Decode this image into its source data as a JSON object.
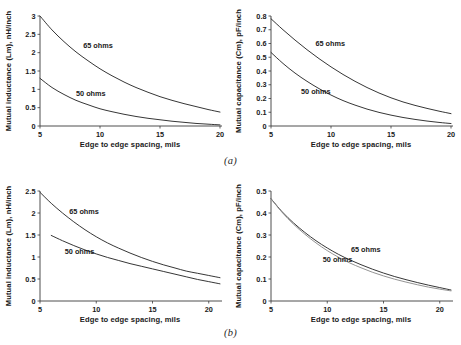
{
  "figure": {
    "captions": {
      "a": "(a)",
      "b": "(b)"
    }
  },
  "panels": [
    {
      "id": "a-left",
      "xlabel": "Edge to edge spacing, mils",
      "ylabel": "Mutual inductance (Lm), nH/inch",
      "labels": {
        "series1": "65 ohms",
        "series2": "50 ohms"
      },
      "ticks": {
        "x": [
          "5",
          "10",
          "15",
          "20"
        ],
        "y": [
          "0",
          "0.5",
          "1",
          "1.5",
          "2",
          "2.5",
          "3"
        ]
      }
    },
    {
      "id": "a-right",
      "xlabel": "Edge to edge spacing, mils",
      "ylabel": "Mutual capacitance (Cm), pF/inch",
      "labels": {
        "series1": "65 ohms",
        "series2": "50 ohms"
      },
      "ticks": {
        "x": [
          "5",
          "10",
          "15",
          "20"
        ],
        "y": [
          "0",
          "0.1",
          "0.2",
          "0.3",
          "0.4",
          "0.5",
          "0.6",
          "0.7",
          "0.8"
        ]
      }
    },
    {
      "id": "b-left",
      "xlabel": "Edge to edge spacing, mils",
      "ylabel": "Mutual inductance (Lm), nH/inch",
      "labels": {
        "series1": "65 ohms",
        "series2": "50 ohms"
      },
      "ticks": {
        "x": [
          "5",
          "10",
          "15",
          "20"
        ],
        "y": [
          "0",
          "0.5",
          "1",
          "1.5",
          "2",
          "2.5"
        ]
      }
    },
    {
      "id": "b-right",
      "xlabel": "Edge to edge spacing, mils",
      "ylabel": "Mutual capacitance (Cm), pF/inch",
      "labels": {
        "series1": "65 ohms",
        "series2": "50 ohms"
      },
      "ticks": {
        "x": [
          "5",
          "10",
          "15",
          "20"
        ],
        "y": [
          "0",
          "0.1",
          "0.2",
          "0.3",
          "0.4",
          "0.5"
        ]
      }
    }
  ],
  "chart_data": [
    {
      "id": "a-left",
      "type": "line",
      "title": "",
      "xlabel": "Edge to edge spacing, mils",
      "ylabel": "Mutual inductance (Lm), nH/inch",
      "xlim": [
        5,
        20
      ],
      "ylim": [
        0,
        3
      ],
      "xticks": [
        5,
        10,
        15,
        20
      ],
      "yticks": [
        0,
        0.5,
        1,
        1.5,
        2,
        2.5,
        3
      ],
      "grid": false,
      "legend": "inline-annotations",
      "series": [
        {
          "name": "65 ohms",
          "color": "#2b2b2b",
          "label_pos": [
            8.6,
            2.12
          ],
          "x": [
            5,
            6,
            7,
            8,
            9,
            10,
            11,
            12,
            13,
            14,
            15,
            16,
            17,
            18,
            19,
            20
          ],
          "values": [
            3.0,
            2.62,
            2.3,
            2.02,
            1.78,
            1.56,
            1.37,
            1.2,
            1.05,
            0.92,
            0.8,
            0.7,
            0.61,
            0.53,
            0.45,
            0.38
          ]
        },
        {
          "name": "50 ohms",
          "color": "#2b2b2b",
          "label_pos": [
            8.0,
            0.82
          ],
          "x": [
            5,
            6,
            7,
            8,
            9,
            10,
            11,
            12,
            13,
            14,
            15,
            16,
            17,
            18,
            19,
            20
          ],
          "values": [
            1.3,
            1.05,
            0.86,
            0.7,
            0.58,
            0.47,
            0.39,
            0.32,
            0.26,
            0.21,
            0.17,
            0.13,
            0.1,
            0.07,
            0.05,
            0.03
          ]
        }
      ]
    },
    {
      "id": "a-right",
      "type": "line",
      "title": "",
      "xlabel": "Edge to edge spacing, mils",
      "ylabel": "Mutual capacitance (Cm), pF/inch",
      "xlim": [
        5,
        20
      ],
      "ylim": [
        0,
        0.8
      ],
      "xticks": [
        5,
        10,
        15,
        20
      ],
      "yticks": [
        0,
        0.1,
        0.2,
        0.3,
        0.4,
        0.5,
        0.6,
        0.7,
        0.8
      ],
      "grid": false,
      "legend": "inline-annotations",
      "series": [
        {
          "name": "65 ohms",
          "color": "#2b2b2b",
          "label_pos": [
            8.7,
            0.585
          ],
          "x": [
            5,
            6,
            7,
            8,
            9,
            10,
            11,
            12,
            13,
            14,
            15,
            16,
            17,
            18,
            19,
            20
          ],
          "values": [
            0.78,
            0.7,
            0.625,
            0.555,
            0.49,
            0.43,
            0.375,
            0.325,
            0.28,
            0.24,
            0.205,
            0.175,
            0.15,
            0.128,
            0.108,
            0.09
          ]
        },
        {
          "name": "50 ohms",
          "color": "#2b2b2b",
          "label_pos": [
            7.5,
            0.235
          ],
          "x": [
            5,
            6,
            7,
            8,
            9,
            10,
            11,
            12,
            13,
            14,
            15,
            16,
            17,
            18,
            19,
            20
          ],
          "values": [
            0.535,
            0.455,
            0.385,
            0.325,
            0.272,
            0.225,
            0.185,
            0.152,
            0.123,
            0.099,
            0.079,
            0.062,
            0.048,
            0.036,
            0.026,
            0.018
          ]
        }
      ]
    },
    {
      "id": "b-left",
      "type": "line",
      "title": "",
      "xlabel": "Edge to edge spacing, mils",
      "ylabel": "Mutual inductance (Lm), nH/inch",
      "xlim": [
        5,
        21
      ],
      "ylim": [
        0,
        2.5
      ],
      "xticks": [
        5,
        10,
        15,
        20
      ],
      "yticks": [
        0,
        0.5,
        1,
        1.5,
        2,
        2.5
      ],
      "grid": false,
      "legend": "inline-annotations",
      "series": [
        {
          "name": "65 ohms",
          "color": "#2b2b2b",
          "label_pos": [
            7.6,
            1.98
          ],
          "x": [
            5,
            6,
            7,
            8,
            9,
            10,
            11,
            12,
            13,
            14,
            15,
            16,
            17,
            18,
            19,
            20,
            21
          ],
          "values": [
            2.47,
            2.22,
            2.0,
            1.8,
            1.62,
            1.46,
            1.32,
            1.2,
            1.09,
            0.99,
            0.9,
            0.82,
            0.75,
            0.68,
            0.63,
            0.58,
            0.53
          ]
        },
        {
          "name": "50 ohms",
          "color": "#2b2b2b",
          "label_pos": [
            7.2,
            1.06
          ],
          "x": [
            6,
            7,
            8,
            9,
            10,
            11,
            12,
            13,
            14,
            15,
            16,
            17,
            18,
            19,
            20,
            21
          ],
          "values": [
            1.49,
            1.37,
            1.26,
            1.16,
            1.07,
            0.99,
            0.92,
            0.85,
            0.79,
            0.73,
            0.67,
            0.61,
            0.55,
            0.49,
            0.44,
            0.39
          ]
        }
      ]
    },
    {
      "id": "b-right",
      "type": "line",
      "title": "",
      "xlabel": "Edge to edge spacing, mils",
      "ylabel": "Mutual capacitance (Cm), pF/inch",
      "xlim": [
        5,
        21
      ],
      "ylim": [
        0,
        0.5
      ],
      "xticks": [
        5,
        10,
        15,
        20
      ],
      "yticks": [
        0,
        0.1,
        0.2,
        0.3,
        0.4,
        0.5
      ],
      "grid": false,
      "legend": "inline-annotations",
      "series": [
        {
          "name": "65 ohms",
          "color": "#2b2b2b",
          "label_pos": [
            12.1,
            0.222
          ],
          "x": [
            5,
            6,
            7,
            8,
            9,
            10,
            11,
            12,
            13,
            14,
            15,
            16,
            17,
            18,
            19,
            20,
            21
          ],
          "values": [
            0.465,
            0.405,
            0.355,
            0.312,
            0.274,
            0.241,
            0.212,
            0.187,
            0.165,
            0.145,
            0.127,
            0.111,
            0.097,
            0.084,
            0.072,
            0.061,
            0.05
          ]
        },
        {
          "name": "50 ohms",
          "color": "#8d8d8d",
          "label_pos": [
            9.6,
            0.178
          ],
          "x": [
            5,
            6,
            7,
            8,
            9,
            10,
            11,
            12,
            13,
            14,
            15,
            16,
            17,
            18,
            19,
            20,
            21
          ],
          "values": [
            0.465,
            0.402,
            0.349,
            0.304,
            0.264,
            0.229,
            0.199,
            0.173,
            0.151,
            0.131,
            0.114,
            0.099,
            0.086,
            0.074,
            0.063,
            0.054,
            0.046
          ]
        }
      ]
    }
  ]
}
